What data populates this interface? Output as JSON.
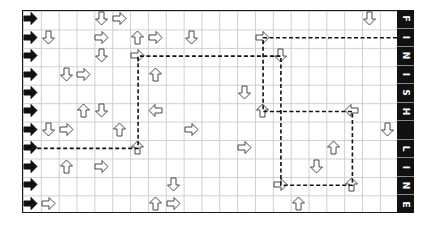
{
  "board": {
    "rows": 11,
    "cols": 21,
    "grid_color": "#cfcfcf",
    "border_color": "#1a1a1a",
    "start_arrow_color": "#111111",
    "arrow_outline_color": "#333333",
    "start_column": {
      "icon": "start-arrow-icon",
      "direction": "right",
      "rows": [
        0,
        1,
        2,
        3,
        4,
        5,
        6,
        7,
        8,
        9,
        10
      ]
    },
    "arrows": [
      {
        "row": 0,
        "col": 4,
        "dir": "down"
      },
      {
        "row": 0,
        "col": 5,
        "dir": "right"
      },
      {
        "row": 0,
        "col": 19,
        "dir": "down"
      },
      {
        "row": 1,
        "col": 1,
        "dir": "down"
      },
      {
        "row": 1,
        "col": 4,
        "dir": "right"
      },
      {
        "row": 1,
        "col": 6,
        "dir": "up"
      },
      {
        "row": 1,
        "col": 7,
        "dir": "right"
      },
      {
        "row": 1,
        "col": 9,
        "dir": "down"
      },
      {
        "row": 1,
        "col": 13,
        "dir": "right"
      },
      {
        "row": 2,
        "col": 4,
        "dir": "down"
      },
      {
        "row": 2,
        "col": 6,
        "dir": "right"
      },
      {
        "row": 2,
        "col": 14,
        "dir": "down"
      },
      {
        "row": 3,
        "col": 2,
        "dir": "down"
      },
      {
        "row": 3,
        "col": 3,
        "dir": "right"
      },
      {
        "row": 3,
        "col": 7,
        "dir": "up"
      },
      {
        "row": 4,
        "col": 12,
        "dir": "down"
      },
      {
        "row": 5,
        "col": 3,
        "dir": "up"
      },
      {
        "row": 5,
        "col": 4,
        "dir": "down"
      },
      {
        "row": 5,
        "col": 7,
        "dir": "left"
      },
      {
        "row": 5,
        "col": 13,
        "dir": "up"
      },
      {
        "row": 5,
        "col": 18,
        "dir": "left"
      },
      {
        "row": 6,
        "col": 1,
        "dir": "down"
      },
      {
        "row": 6,
        "col": 2,
        "dir": "right"
      },
      {
        "row": 6,
        "col": 5,
        "dir": "up"
      },
      {
        "row": 6,
        "col": 9,
        "dir": "right"
      },
      {
        "row": 6,
        "col": 20,
        "dir": "down"
      },
      {
        "row": 7,
        "col": 6,
        "dir": "up"
      },
      {
        "row": 7,
        "col": 12,
        "dir": "right"
      },
      {
        "row": 7,
        "col": 17,
        "dir": "up"
      },
      {
        "row": 8,
        "col": 2,
        "dir": "up"
      },
      {
        "row": 8,
        "col": 4,
        "dir": "right"
      },
      {
        "row": 8,
        "col": 16,
        "dir": "down"
      },
      {
        "row": 9,
        "col": 8,
        "dir": "down"
      },
      {
        "row": 9,
        "col": 14,
        "dir": "right"
      },
      {
        "row": 9,
        "col": 18,
        "dir": "up"
      },
      {
        "row": 10,
        "col": 1,
        "dir": "right"
      },
      {
        "row": 10,
        "col": 7,
        "dir": "up"
      },
      {
        "row": 10,
        "col": 8,
        "dir": "right"
      },
      {
        "row": 10,
        "col": 15,
        "dir": "up"
      }
    ],
    "solution_path": {
      "style": "dashed",
      "color": "#111111",
      "points": [
        {
          "row": 7,
          "col": 0
        },
        {
          "row": 7,
          "col": 6
        },
        {
          "row": 2,
          "col": 6
        },
        {
          "row": 2,
          "col": 14
        },
        {
          "row": 9,
          "col": 14
        },
        {
          "row": 9,
          "col": 18
        },
        {
          "row": 5,
          "col": 18
        },
        {
          "row": 5,
          "col": 13
        },
        {
          "row": 1,
          "col": 13
        },
        {
          "row": 1,
          "col": 21
        }
      ]
    }
  },
  "finish_line": {
    "label": "FINISH LINE",
    "letters": [
      "F",
      "I",
      "N",
      "I",
      "S",
      "H",
      "",
      "L",
      "I",
      "N",
      "E"
    ],
    "background": "#111111",
    "text_color": "#ffffff"
  }
}
